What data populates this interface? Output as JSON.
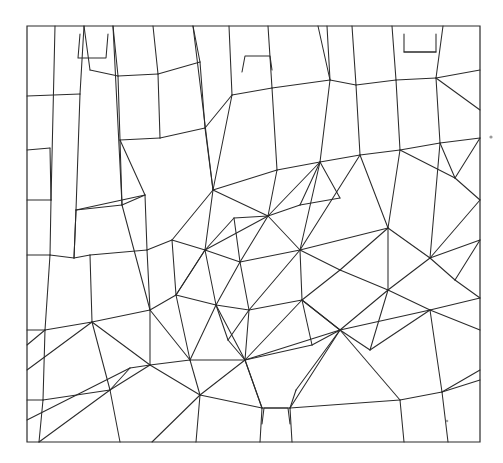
{
  "document": {
    "kind": "line-drawing",
    "title": "Polygonal subdivision figure",
    "description": "Black line drawing of a rectangular frame subdivided into many irregular polygons, with several radial fan hubs near the centre and small rectangular notches along the top and bottom borders.",
    "background_color": "#ffffff",
    "ink_color": "#2b2b2b",
    "width": 503,
    "height": 463
  },
  "figure": {
    "frame": {
      "label": "outer-frame",
      "points": "27,26 480,26 480,442 27,442 27,26",
      "stroke": "#2b2b2b",
      "stroke_width": 1.2
    },
    "stroke": "#2b2b2b",
    "stroke_width": 1.05,
    "edges": [
      "M27,26 L480,26 L480,442 L27,442 Z",
      "M55,26 L51,200",
      "M51,200 L50,255",
      "M50,255 L45,330",
      "M27,96 L80,94",
      "M80,94 L84,26",
      "M80,94 L76,210",
      "M76,210 L74,258",
      "M27,200 L51,200",
      "M27,255 L50,255",
      "M50,255 L74,258",
      "M74,258 L76,210",
      "M76,210 L122,205",
      "M122,205 L120,140",
      "M120,140 L160,138",
      "M160,138 L158,74",
      "M158,74 L118,76",
      "M118,76 L120,140",
      "M118,76 L113,26",
      "M84,26 L90,70",
      "M90,70 L118,76",
      "M27,330 L45,330",
      "M45,330 L43,400",
      "M27,400 L43,400",
      "M43,400 L39,442",
      "M45,330 L92,322",
      "M92,322 L90,255",
      "M90,255 L74,258",
      "M92,322 L150,310",
      "M150,310 L147,250",
      "M147,250 L90,255",
      "M147,250 L145,195",
      "M145,195 L76,210",
      "M145,195 L120,140",
      "M113,26 L122,205",
      "M122,205 L145,195",
      "M160,138 L205,128",
      "M205,128 L200,62",
      "M200,62 L158,74",
      "M158,74 L153,26",
      "M200,62 L193,26",
      "M150,310 L176,295",
      "M176,295 L172,240",
      "M172,240 L147,250",
      "M176,295 L205,250",
      "M205,250 L172,240",
      "M205,128 L213,190",
      "M213,190 L172,240",
      "M213,190 L205,250",
      "M193,26 L213,190",
      "M213,190 L232,95",
      "M232,95 L205,128",
      "M232,95 L229,26",
      "M232,95 L272,88",
      "M272,88 L268,26",
      "M272,88 L277,170",
      "M277,170 L213,190",
      "M272,88 L330,80",
      "M330,80 L327,26",
      "M330,80 L318,26",
      "M277,170 L320,162",
      "M320,162 L330,80",
      "M320,162 L360,155",
      "M360,155 L356,85",
      "M356,85 L330,80",
      "M356,85 L352,26",
      "M360,155 L400,150",
      "M400,150 L396,80",
      "M396,80 L356,85",
      "M396,80 L392,26",
      "M400,150 L440,143",
      "M440,143 L436,78",
      "M436,78 L396,80",
      "M436,78 L443,26",
      "M440,143 L480,138",
      "M436,78 L480,70",
      "M404,34 L404,52 L436,52 L436,34",
      "M404,52 L436,52",
      "M242,72 L245,56 L270,56 L272,70",
      "M80,34 L78,58 L106,58 L108,34",
      "M262,424 L264,408 L288,408 L290,424",
      "M213,190 L268,216",
      "M268,216 L277,170",
      "M268,216 L320,162",
      "M268,216 L300,250",
      "M300,250 L320,162",
      "M300,250 L360,155",
      "M360,155 L388,228",
      "M388,228 L300,250",
      "M388,228 L400,150",
      "M388,228 L430,258",
      "M430,258 L440,143",
      "M430,258 L480,240",
      "M480,200 L430,258",
      "M480,138 L455,178",
      "M455,178 L440,143",
      "M455,178 L480,200",
      "M455,178 L400,150",
      "M205,250 L268,216",
      "M205,250 L240,262",
      "M240,262 L268,216",
      "M240,262 L300,250",
      "M176,295 L205,250",
      "M205,250 L216,305",
      "M216,305 L176,295",
      "M216,305 L240,262",
      "M240,262 L249,310",
      "M249,310 L216,305",
      "M249,310 L300,250",
      "M300,250 L302,300",
      "M302,300 L249,310",
      "M302,300 L340,270",
      "M340,270 L300,250",
      "M340,270 L388,228",
      "M340,270 L388,290",
      "M388,290 L430,258",
      "M388,290 L388,228",
      "M302,300 L340,330",
      "M340,330 L388,290",
      "M340,330 L302,300",
      "M249,310 L245,360",
      "M245,360 L302,300",
      "M245,360 L216,305",
      "M245,360 L340,330",
      "M216,305 L190,360",
      "M190,360 L245,360",
      "M190,360 L176,295",
      "M150,310 L190,360",
      "M190,360 L150,365",
      "M150,365 L150,310",
      "M245,360 L262,408",
      "M262,408 L245,360",
      "M290,408 L340,330",
      "M245,360 L200,395",
      "M200,395 L190,360",
      "M200,395 L262,408",
      "M150,365 L200,395",
      "M150,365 L92,322",
      "M92,322 L110,390",
      "M110,390 L150,365",
      "M110,390 L43,400",
      "M110,390 L120,442",
      "M200,395 L196,442",
      "M200,395 L152,442",
      "M39,442 L110,390",
      "M27,420 L130,368",
      "M130,368 L150,365",
      "M27,370 L92,322",
      "M45,330 L27,345",
      "M340,330 L430,310",
      "M430,310 L388,290",
      "M430,310 L480,298",
      "M430,310 L442,392",
      "M442,392 L480,380",
      "M442,392 L400,400",
      "M400,400 L340,330",
      "M400,400 L404,442",
      "M442,392 L448,442",
      "M480,330 L430,310",
      "M290,408 L400,400",
      "M262,408 L290,408",
      "M290,408 L292,442",
      "M262,408 L260,442",
      "M340,330 L296,390",
      "M296,390 L290,408",
      "M320,162 L300,205",
      "M300,205 L268,216",
      "M300,205 L340,198",
      "M340,198 L320,162",
      "M240,262 L234,218",
      "M234,218 L205,250",
      "M234,218 L268,216",
      "M216,305 L228,340",
      "M228,340 L245,360",
      "M228,340 L249,310",
      "M302,300 L312,345",
      "M312,345 L340,330",
      "M312,345 L245,360",
      "M388,290 L370,350",
      "M370,350 L430,310",
      "M370,350 L340,330",
      "M480,240 L455,280",
      "M455,280 L430,258",
      "M455,280 L480,298",
      "M150,310 L122,205",
      "M130,368 L110,390",
      "M27,150 L50,148",
      "M50,148 L51,200",
      "M480,110 L436,78",
      "M480,370 L442,392"
    ]
  },
  "artifacts": {
    "specks": [
      {
        "name": "speck-right-margin",
        "x": 491,
        "y": 137,
        "r": 1.6
      },
      {
        "name": "speck-lower-right",
        "x": 447,
        "y": 421,
        "r": 1.3
      }
    ]
  },
  "annotations": {
    "has_text_labels": false,
    "note": "No textual labels, axis ticks, legend or numbers appear anywhere in the figure."
  }
}
